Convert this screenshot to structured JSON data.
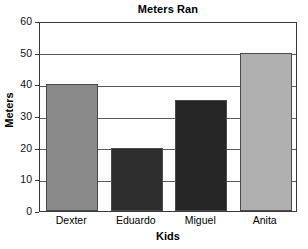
{
  "chart_data": {
    "type": "bar",
    "title": "Meters Ran",
    "xlabel": "Kids",
    "ylabel": "Meters",
    "categories": [
      "Dexter",
      "Eduardo",
      "Miguel",
      "Anita"
    ],
    "values": [
      40,
      20,
      35,
      50
    ],
    "ylim": [
      0,
      60
    ],
    "ytick_labels": [
      "0",
      "10",
      "20",
      "30",
      "40",
      "50",
      "60"
    ],
    "ytick_values": [
      0,
      10,
      20,
      30,
      40,
      50,
      60
    ],
    "grid": "horizontal",
    "legend": "none",
    "bar_colors": [
      "#8a8a8a",
      "#2e2e2e",
      "#262626",
      "#b0b0b0"
    ],
    "series": [
      {
        "name": "Meters Ran",
        "points": [
          {
            "category": "Dexter",
            "value": 40,
            "color": "#8a8a8a"
          },
          {
            "category": "Eduardo",
            "value": 20,
            "color": "#2e2e2e"
          },
          {
            "category": "Miguel",
            "value": 35,
            "color": "#262626"
          },
          {
            "category": "Anita",
            "value": 50,
            "color": "#b0b0b0"
          }
        ]
      }
    ]
  },
  "colors": {
    "background": "#ffffff",
    "axis": "#3a3a3a",
    "gridline": "#5a5a5a",
    "text": "#000000"
  }
}
